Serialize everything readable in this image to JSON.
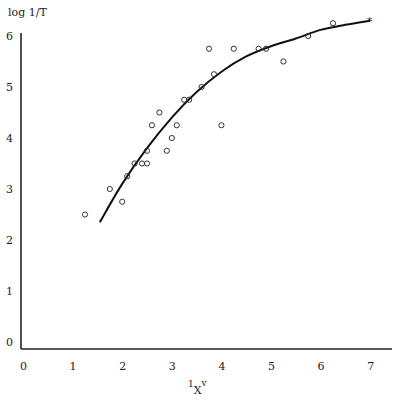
{
  "chart_data": {
    "type": "scatter",
    "title": "",
    "ylabel": "log 1/T",
    "xlabel": "1Xv",
    "xlabel_main": "X",
    "xlabel_sup": "v",
    "xlabel_pre": "1",
    "xlim": [
      0,
      7
    ],
    "ylim": [
      0,
      6
    ],
    "x_ticks": [
      "0",
      "1",
      "2",
      "3",
      "4",
      "5",
      "6",
      "7"
    ],
    "y_ticks": [
      "0",
      "1",
      "2",
      "3",
      "4",
      "5",
      "6"
    ],
    "grid": false,
    "legend": null,
    "series": [
      {
        "name": "observed",
        "marker": "open-circle",
        "points": [
          [
            1.25,
            2.5
          ],
          [
            1.75,
            3.0
          ],
          [
            2.0,
            2.75
          ],
          [
            2.1,
            3.25
          ],
          [
            2.25,
            3.5
          ],
          [
            2.4,
            3.5
          ],
          [
            2.5,
            3.5
          ],
          [
            2.5,
            3.75
          ],
          [
            2.6,
            4.25
          ],
          [
            2.75,
            4.5
          ],
          [
            2.9,
            3.75
          ],
          [
            3.0,
            4.0
          ],
          [
            3.1,
            4.25
          ],
          [
            3.25,
            4.75
          ],
          [
            3.35,
            4.75
          ],
          [
            3.6,
            5.0
          ],
          [
            3.75,
            5.75
          ],
          [
            3.85,
            5.25
          ],
          [
            4.0,
            4.25
          ],
          [
            4.25,
            5.75
          ],
          [
            4.75,
            5.75
          ],
          [
            4.9,
            5.75
          ],
          [
            5.25,
            5.5
          ],
          [
            5.75,
            6.0
          ],
          [
            6.25,
            6.25
          ]
        ]
      },
      {
        "name": "reference",
        "marker": "star",
        "points": [
          [
            7.0,
            6.3
          ]
        ]
      },
      {
        "name": "fitted curve",
        "type": "line",
        "points": [
          [
            1.55,
            2.35
          ],
          [
            2.0,
            3.1
          ],
          [
            2.5,
            3.8
          ],
          [
            3.0,
            4.4
          ],
          [
            3.5,
            4.9
          ],
          [
            4.0,
            5.3
          ],
          [
            4.5,
            5.6
          ],
          [
            5.0,
            5.8
          ],
          [
            5.5,
            5.95
          ],
          [
            6.0,
            6.12
          ],
          [
            6.5,
            6.22
          ],
          [
            7.0,
            6.3
          ]
        ]
      }
    ]
  }
}
